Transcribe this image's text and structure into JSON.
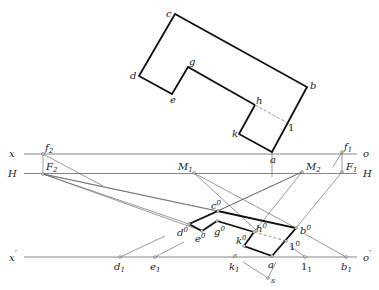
{
  "diagram": {
    "type": "perspective construction of plan figure",
    "plan_labels": {
      "c": "c",
      "b": "b",
      "d": "d",
      "e": "e",
      "g": "g",
      "h": "h",
      "k": "k",
      "one": "1",
      "a": "a"
    },
    "axis_labels": {
      "x": "x",
      "o": "o",
      "H_left": "H",
      "H_right": "H",
      "x_prime": "x",
      "prime": "′",
      "o_prime": "o",
      "o_prime_mark": "′"
    },
    "point_labels": {
      "f2": "f",
      "f2_sub": "2",
      "F2": "F",
      "F2_sub": "2",
      "M1": "M",
      "M1_sub": "1",
      "M2": "M",
      "M2_sub": "2",
      "F1": "F",
      "F1_sub": "1",
      "f1": "f",
      "f1_sub": "1"
    },
    "perspective_labels": {
      "c0": "c",
      "d0": "d",
      "e0": "e",
      "g0": "g",
      "h0": "h",
      "k0": "k",
      "b0": "b",
      "one0": "1",
      "sup": "0"
    },
    "ground_labels": {
      "d1": "d",
      "e1": "e",
      "k1": "k",
      "a": "a",
      "one1": "1",
      "b1": "b",
      "sub": "1",
      "s": "s"
    }
  }
}
